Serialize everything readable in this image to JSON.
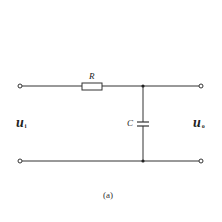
{
  "diagram": {
    "type": "RC low-pass filter circuit",
    "components": {
      "resistor": {
        "label": "R"
      },
      "capacitor": {
        "label": "C"
      }
    },
    "input": {
      "symbol": "u",
      "subscript": "i"
    },
    "output": {
      "symbol": "u",
      "subscript": "o"
    },
    "caption": "(a)",
    "colors": {
      "wire": "#333333",
      "background": "#ffffff"
    }
  }
}
